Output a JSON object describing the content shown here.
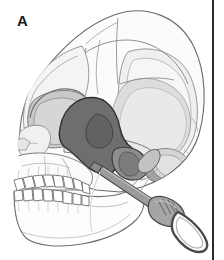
{
  "figure": {
    "panel_label": "A",
    "caption_text": "",
    "background_color": "#ffffff"
  },
  "palette": {
    "outline": "#5a5a5a",
    "outline_dark": "#2b2b2b",
    "bone_light": "#f7f7f7",
    "bone_shadow": "#ededed",
    "shade_light_gray": "#d9d9d9",
    "shade_mid_gray": "#b9b9b9",
    "shade_dark_gray": "#8d8d8d",
    "shade_darkest_gray": "#6e6e6e",
    "instrument_body": "#9b9b9b",
    "instrument_highlight": "#c9c9c9",
    "instrument_outline": "#4a4a4a",
    "divider_line": "#2b2b2b",
    "label_color": "#1a1a1a"
  },
  "regions": [
    {
      "name": "cranial-vault",
      "label": "",
      "fill": "#fbfbfb",
      "shade": "light"
    },
    {
      "name": "frontal-bone",
      "label": "",
      "fill": "#f7f7f7",
      "shade": "light"
    },
    {
      "name": "parietal-bone",
      "label": "",
      "fill": "#f2f2f2",
      "shade": "light"
    },
    {
      "name": "temporal-fossa-shading",
      "label": "",
      "fill": "#d2d2d2",
      "shade": "mid"
    },
    {
      "name": "zygomatic-arch",
      "label": "",
      "fill": "#e8e8e8",
      "shade": "light"
    },
    {
      "name": "orbit-eye-socket",
      "label": "",
      "fill": "#c8c8c8",
      "shade": "mid"
    },
    {
      "name": "pterygopalatine-fossa-highlight",
      "label": "",
      "fill": "#6e6e6e",
      "shade": "darkest"
    },
    {
      "name": "infratemporal-fossa-highlight",
      "label": "",
      "fill": "#8d8d8d",
      "shade": "dark"
    },
    {
      "name": "maxilla",
      "label": "",
      "fill": "#fafafa",
      "shade": "light"
    },
    {
      "name": "mandible",
      "label": "",
      "fill": "#fcfcfc",
      "shade": "light"
    },
    {
      "name": "nasal-aperture",
      "label": "",
      "fill": "#ededed",
      "shade": "light"
    },
    {
      "name": "upper-teeth-row",
      "label": "",
      "fill": "#ffffff",
      "shade": "none"
    },
    {
      "name": "lower-teeth-row",
      "label": "",
      "fill": "#ffffff",
      "shade": "none"
    },
    {
      "name": "occipital-region",
      "label": "",
      "fill": "#e4e4e4",
      "shade": "light"
    },
    {
      "name": "mastoid-process",
      "label": "",
      "fill": "#cfcfcf",
      "shade": "mid"
    }
  ],
  "instrument": {
    "name": "surgical-scalpel-elevator",
    "label": "",
    "body_color": "#9b9b9b",
    "highlight_color": "#c9c9c9",
    "outline_color": "#4a4a4a",
    "tip_location": "infratemporal-fossa",
    "orientation": "from-lower-right-to-upper-left"
  },
  "divider": {
    "name": "panel-divider",
    "orientation": "vertical",
    "x": 212,
    "color": "#2b2b2b"
  }
}
